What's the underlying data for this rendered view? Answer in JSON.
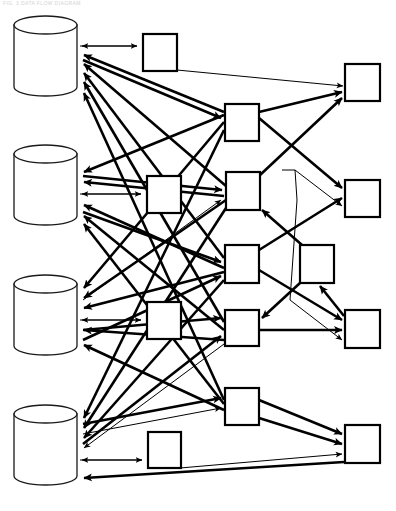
{
  "page": {
    "width": 396,
    "height": 511,
    "background_color": "#ffffff",
    "header_text": "FIG. 3  DATA FLOW DIAGRAM",
    "header_text_color": "#d2d2d2",
    "line_color": "#000000"
  },
  "diagram": {
    "type": "dataflow-diagram",
    "stroke_color": "#000000",
    "fill_color": "#ffffff",
    "thick_stroke_width": 2.6,
    "thin_stroke_width": 1.0,
    "databases": [
      {
        "id": "db1",
        "label": "",
        "x": 14,
        "y": 16,
        "w": 63,
        "h": 80,
        "ellipse_ry": 9
      },
      {
        "id": "db2",
        "label": "",
        "x": 14,
        "y": 145,
        "w": 63,
        "h": 80,
        "ellipse_ry": 9
      },
      {
        "id": "db3",
        "label": "",
        "x": 14,
        "y": 275,
        "w": 63,
        "h": 80,
        "ellipse_ry": 9
      },
      {
        "id": "db4",
        "label": "",
        "x": 14,
        "y": 405,
        "w": 63,
        "h": 80,
        "ellipse_ry": 9
      }
    ],
    "boxes": [
      {
        "id": "p1",
        "label": "",
        "x": 143,
        "y": 34,
        "w": 34,
        "h": 37
      },
      {
        "id": "p2",
        "label": "",
        "x": 225,
        "y": 104,
        "w": 34,
        "h": 37
      },
      {
        "id": "p3",
        "label": "",
        "x": 147,
        "y": 176,
        "w": 34,
        "h": 37
      },
      {
        "id": "p4",
        "label": "",
        "x": 226,
        "y": 172,
        "w": 34,
        "h": 38
      },
      {
        "id": "p5",
        "label": "",
        "x": 225,
        "y": 245,
        "w": 34,
        "h": 38
      },
      {
        "id": "p6",
        "label": "",
        "x": 300,
        "y": 245,
        "w": 34,
        "h": 38
      },
      {
        "id": "p7",
        "label": "",
        "x": 147,
        "y": 302,
        "w": 34,
        "h": 37
      },
      {
        "id": "p8",
        "label": "",
        "x": 225,
        "y": 310,
        "w": 34,
        "h": 36
      },
      {
        "id": "p9",
        "label": "",
        "x": 225,
        "y": 388,
        "w": 34,
        "h": 37
      },
      {
        "id": "p10",
        "label": "",
        "x": 148,
        "y": 432,
        "w": 33,
        "h": 36
      },
      {
        "id": "r1",
        "label": "",
        "x": 345,
        "y": 64,
        "w": 35,
        "h": 37
      },
      {
        "id": "r2",
        "label": "",
        "x": 345,
        "y": 180,
        "w": 35,
        "h": 37
      },
      {
        "id": "r3",
        "label": "",
        "x": 345,
        "y": 310,
        "w": 35,
        "h": 38
      },
      {
        "id": "r4",
        "label": "",
        "x": 345,
        "y": 425,
        "w": 35,
        "h": 38
      }
    ],
    "edge_count": 34,
    "legend": []
  }
}
